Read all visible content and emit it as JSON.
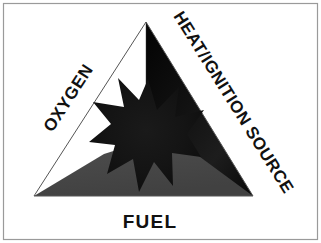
{
  "figure": {
    "name": "fire-triangle",
    "background_color": "#ffffff",
    "border_color": "#9a9a9a"
  },
  "diagram": {
    "type": "fire-triangle",
    "vertices": {
      "apex": [
        146,
        22
      ],
      "bottom_left": [
        34,
        196
      ],
      "bottom_right": [
        253,
        196
      ]
    },
    "regions": [
      {
        "name": "oxygen-region",
        "label": "OXYGEN",
        "fill": "#ffffff",
        "position": "left"
      },
      {
        "name": "heat-region",
        "label": "HEAT/IGNITION SOURCE",
        "fill": "#0b0b0b",
        "position": "right"
      },
      {
        "name": "fuel-region",
        "label": "FUEL",
        "fill": "#4a4a4a",
        "position": "bottom"
      }
    ],
    "center_burst": {
      "name": "fire-starburst",
      "points": 12,
      "fill": "#121212",
      "center": [
        148,
        133
      ],
      "outer_radius": 54,
      "inner_radius": 27
    }
  },
  "labels": {
    "oxygen": {
      "text": "OXYGEN",
      "rotation_deg": -57,
      "x": 73,
      "y": 101,
      "font_size": 17,
      "color": "#111111"
    },
    "heat": {
      "text": "HEAT/IGNITION SOURCE",
      "rotation_deg": 58,
      "x": 173,
      "y": 16,
      "font_size": 17,
      "color": "#111111"
    },
    "fuel": {
      "text": "FUEL",
      "rotation_deg": 0,
      "x": 150,
      "y": 228,
      "font_size": 19,
      "color": "#111111"
    }
  },
  "colors": {
    "white": "#ffffff",
    "black": "#0b0b0b",
    "gray": "#4a4a4a",
    "outline": "#555555",
    "border": "#9a9a9a"
  }
}
